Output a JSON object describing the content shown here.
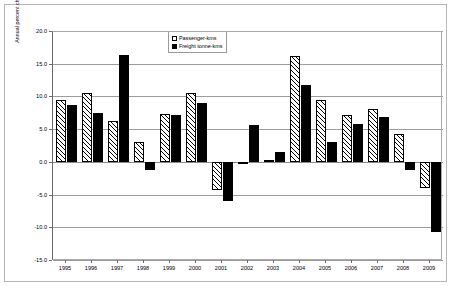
{
  "chart_data": {
    "type": "bar",
    "title": "",
    "subtitle": "",
    "xlabel": "",
    "ylabel": "Annual percent change",
    "ylim": [
      -15.0,
      20.0
    ],
    "ytick_step": 5.0,
    "ytick_labels": [
      "20.0",
      "15.0",
      "10.0",
      "5.0",
      "0.0",
      "-5.0",
      "-10.0",
      "-15.0"
    ],
    "ytick_values": [
      20.0,
      15.0,
      10.0,
      5.0,
      0.0,
      -5.0,
      -10.0,
      -15.0
    ],
    "grid": true,
    "legend_position": "top-right",
    "categories": [
      "1995",
      "1996",
      "1997",
      "1998",
      "1999",
      "2000",
      "2001",
      "2002",
      "2003",
      "2004",
      "2005",
      "2006",
      "2007",
      "2008",
      "2009"
    ],
    "series": [
      {
        "name": "Passenger-kms",
        "style": "hatched",
        "values": [
          9.4,
          10.5,
          6.3,
          3.0,
          7.3,
          10.5,
          -4.3,
          -0.3,
          0.3,
          16.2,
          9.4,
          7.2,
          8.1,
          4.2,
          -4.0
        ]
      },
      {
        "name": "Freight tonne-kms",
        "style": "solid-black",
        "values": [
          8.7,
          7.4,
          16.3,
          -1.3,
          7.2,
          9.0,
          -6.0,
          5.6,
          1.5,
          11.8,
          3.0,
          5.8,
          6.9,
          -1.2,
          -10.7
        ]
      }
    ]
  },
  "legend": {
    "items": [
      {
        "label": "Passenger-kms",
        "style": "passenger"
      },
      {
        "label": "Freight tonne-kms",
        "style": "freight"
      }
    ]
  }
}
